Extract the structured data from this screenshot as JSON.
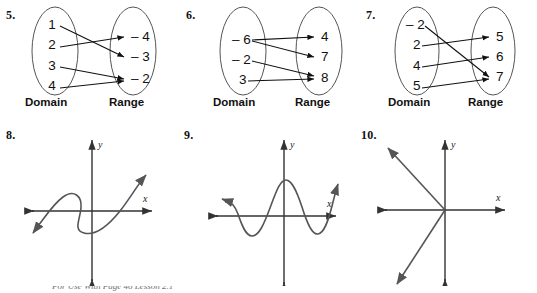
{
  "worksheet": {
    "bottom_note": "For Use With Page 46 Lesson 2.1",
    "domain_label": "Domain",
    "range_label": "Range",
    "axis_x_label": "x",
    "axis_y_label": "y"
  },
  "problems": [
    {
      "number": "5.",
      "type": "mapping-diagram",
      "domain_label": "Domain",
      "range_label": "Range",
      "domain_values": [
        "1",
        "2",
        "3",
        "4"
      ],
      "range_values": [
        "– 4",
        "– 3",
        "– 2"
      ],
      "arrows": [
        {
          "from": "1",
          "to": "– 3"
        },
        {
          "from": "2",
          "to": "– 4"
        },
        {
          "from": "3",
          "to": "– 2"
        },
        {
          "from": "4",
          "to": "– 2"
        }
      ]
    },
    {
      "number": "6.",
      "type": "mapping-diagram",
      "domain_label": "Domain",
      "range_label": "Range",
      "domain_values": [
        "– 6",
        "– 2",
        "3"
      ],
      "range_values": [
        "4",
        "7",
        "8"
      ],
      "arrows": [
        {
          "from": "– 6",
          "to": "4"
        },
        {
          "from": "– 6",
          "to": "7"
        },
        {
          "from": "– 2",
          "to": "8"
        },
        {
          "from": "3",
          "to": "8"
        }
      ]
    },
    {
      "number": "7.",
      "type": "mapping-diagram",
      "domain_label": "Domain",
      "range_label": "Range",
      "domain_values": [
        "– 2",
        "2",
        "4",
        "5"
      ],
      "range_values": [
        "5",
        "6",
        "7"
      ],
      "arrows": [
        {
          "from": "– 2",
          "to": "7"
        },
        {
          "from": "2",
          "to": "5"
        },
        {
          "from": "4",
          "to": "6"
        },
        {
          "from": "5",
          "to": "7"
        }
      ]
    },
    {
      "number": "8.",
      "type": "graph",
      "x_label": "x",
      "y_label": "y",
      "description": "S-shaped cubic-like curve rotated, doubles back so a vertical line crosses it three times"
    },
    {
      "number": "9.",
      "type": "graph",
      "x_label": "x",
      "y_label": "y",
      "description": "Wavy sinusoidal curve with a trough left of the y-axis, a tall crest at the y-axis, a trough to the right, then rising"
    },
    {
      "number": "10.",
      "type": "graph",
      "x_label": "x",
      "y_label": "y",
      "description": "Two rays from the origin: one to the upper-left and one to the lower-left"
    }
  ]
}
